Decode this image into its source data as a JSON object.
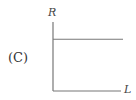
{
  "panel_label": "(C)",
  "chart_data": {
    "type": "line",
    "title": "",
    "xlabel": "L",
    "ylabel": "R",
    "series": [
      {
        "name": "R vs L",
        "x": [
          0,
          1
        ],
        "values": [
          0.75,
          0.75
        ]
      }
    ],
    "xlim": [
      0,
      1
    ],
    "ylim": [
      0,
      1
    ],
    "grid": false,
    "annotations": [
      "R is constant, independent of L"
    ]
  },
  "colors": {
    "axis": "#777777",
    "line": "#777777",
    "text": "#333333"
  }
}
